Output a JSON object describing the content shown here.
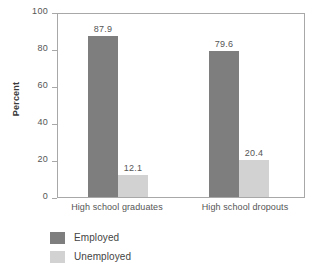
{
  "chart_data": {
    "type": "bar",
    "title": "",
    "xlabel": "",
    "ylabel": "Percent",
    "ylim": [
      0,
      100
    ],
    "yticks": [
      "0",
      "20",
      "40",
      "60",
      "80",
      "100"
    ],
    "grid": false,
    "legend_position": "bottom-left",
    "categories": [
      "High school graduates",
      "High school dropouts"
    ],
    "series": [
      {
        "name": "Employed",
        "color": "#7e7e7e",
        "values": [
          87.9,
          79.6
        ],
        "labels": [
          "87.9",
          "79.6"
        ]
      },
      {
        "name": "Unemployed",
        "color": "#d2d2d2",
        "values": [
          12.1,
          20.4
        ],
        "labels": [
          "12.1",
          "20.4"
        ]
      }
    ]
  },
  "colors": {
    "employed": "#7e7e7e",
    "unemployed": "#d2d2d2",
    "frame": "#a8a8a8",
    "text": "#555555",
    "background": "#ffffff"
  }
}
